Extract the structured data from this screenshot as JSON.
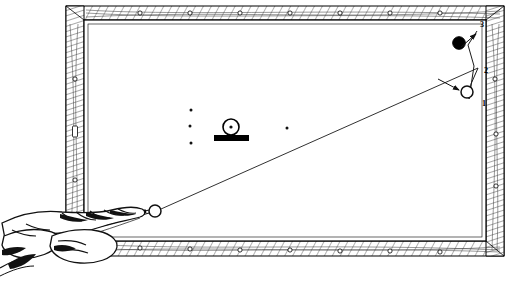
{
  "illustration": {
    "title": "Billiard table aiming diagram",
    "type": "line-art-diagram",
    "view": "overhead",
    "background_color": "#ffffff",
    "ink_color": "#000000"
  },
  "table": {
    "name": "billiard-table",
    "outer_frame": {
      "x": 66,
      "y": 6,
      "width": 438,
      "height": 250
    },
    "cushion_line": {
      "x": 84,
      "y": 20,
      "width": 402,
      "height": 221
    },
    "rail_fill": "#ffffff",
    "rail_hatch_color": "#1a1a1a",
    "rails": [
      {
        "name": "top-rail",
        "sight_count": 7
      },
      {
        "name": "bottom-rail",
        "sight_count": 7
      },
      {
        "name": "left-rail",
        "sight_count": 3
      },
      {
        "name": "right-rail",
        "sight_count": 3
      }
    ],
    "sight_marker": {
      "shape": "circle",
      "radius": 2.1,
      "fill": "#ffffff",
      "stroke": "#000000"
    }
  },
  "balls": [
    {
      "name": "cue-ball",
      "cx": 155,
      "cy": 211,
      "r": 6.0,
      "fill": "#ffffff",
      "stroke": "#000000"
    },
    {
      "name": "object-ball-white",
      "cx": 467,
      "cy": 92,
      "r": 6.0,
      "fill": "#ffffff",
      "stroke": "#000000"
    },
    {
      "name": "object-ball-black",
      "cx": 459,
      "cy": 43,
      "r": 6.3,
      "fill": "#000000",
      "stroke": "#000000"
    },
    {
      "name": "spotted-ball",
      "cx": 231,
      "cy": 127,
      "r": 8.0,
      "fill": "#ffffff",
      "stroke": "#000000",
      "center_dot": true
    }
  ],
  "blocker": {
    "name": "obstacle-block",
    "x": 214,
    "y": 135,
    "width": 35,
    "height": 6,
    "fill": "#000000"
  },
  "table_spots": [
    {
      "name": "table-spot",
      "cx": 191,
      "cy": 110,
      "r": 1.5
    },
    {
      "name": "table-spot",
      "cx": 190,
      "cy": 126,
      "r": 1.5
    },
    {
      "name": "table-spot",
      "cx": 191,
      "cy": 143,
      "r": 1.5
    },
    {
      "name": "table-spot",
      "cx": 287,
      "cy": 128,
      "r": 1.5
    }
  ],
  "aim_line": {
    "name": "aim-line",
    "from": {
      "x": 161,
      "y": 209
    },
    "to": {
      "x": 478,
      "y": 68
    },
    "stroke": "#1a1a1a",
    "width": 0.9
  },
  "path_line": {
    "name": "ball-path-line",
    "points": "478,68 472,84 470,99 474,67 469,44 477,32",
    "stroke": "#1a1a1a",
    "width": 1.0
  },
  "arrows": [
    {
      "name": "arrow-to-object-ball",
      "from": {
        "x": 441,
        "y": 80
      },
      "to": {
        "x": 461,
        "y": 90
      }
    },
    {
      "name": "arrow-to-position-3",
      "from": {
        "x": 461,
        "y": 46
      },
      "to": {
        "x": 477,
        "y": 33
      }
    }
  ],
  "position_labels": [
    {
      "name": "position-label-1",
      "text": "1",
      "x": 482,
      "y": 103
    },
    {
      "name": "position-label-2",
      "text": "2",
      "x": 484,
      "y": 70
    },
    {
      "name": "position-label-3",
      "text": "3",
      "x": 481,
      "y": 25
    }
  ],
  "player": {
    "name": "player-hand-with-cue",
    "description": "hand forming a bridge gripping the cue stick at lower left",
    "cue_stick": {
      "name": "cue-stick",
      "tip": {
        "x": 148,
        "y": 212
      },
      "butt": {
        "x": 0,
        "y": 250
      }
    }
  },
  "caption": {
    "name": "figure-caption",
    "text": "",
    "visible": false
  }
}
